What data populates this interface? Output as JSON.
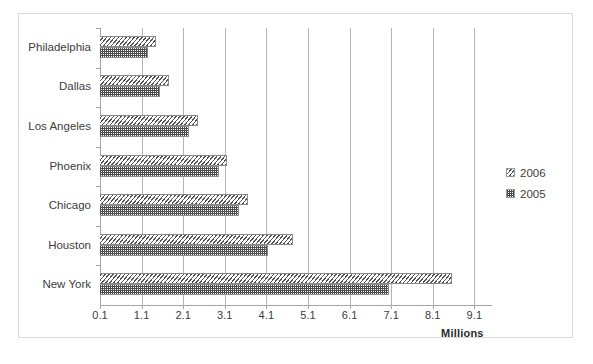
{
  "chart_data": {
    "type": "bar",
    "orientation": "horizontal",
    "title": "",
    "xlabel": "Millions",
    "ylabel": "",
    "grid": true,
    "legend_position": "right",
    "xlim": [
      0.1,
      9.6
    ],
    "xticks": [
      "0.1",
      "1.1",
      "2.1",
      "3.1",
      "4.1",
      "5.1",
      "6.1",
      "7.1",
      "8.1",
      "9.1"
    ],
    "xtick_values": [
      0.1,
      1.1,
      2.1,
      3.1,
      4.1,
      5.1,
      6.1,
      7.1,
      8.1,
      9.1
    ],
    "categories": [
      "Philadelphia",
      "Dallas",
      "Los Angeles",
      "Phoenix",
      "Chicago",
      "Houston",
      "New York"
    ],
    "series": [
      {
        "name": "2006",
        "pattern": "diagonal-hatch",
        "values": [
          1.45,
          1.75,
          2.45,
          3.15,
          3.65,
          4.75,
          8.55
        ]
      },
      {
        "name": "2005",
        "pattern": "checkered-dots",
        "values": [
          1.25,
          1.55,
          2.25,
          2.95,
          3.45,
          4.15,
          7.05
        ]
      }
    ]
  },
  "axis": {
    "x_title": "Millions"
  },
  "legend": {
    "entries": [
      {
        "label": "2006",
        "swatch": "diagonal-hatch-swatch"
      },
      {
        "label": "2005",
        "swatch": "checkered-dots-swatch"
      }
    ]
  },
  "colors": {
    "frame_border": "#d9d9d9",
    "gridline": "#b5b5b5",
    "axis": "#a6a6a6",
    "text": "#3d3d3d",
    "bar_ink": "#4a4a4a",
    "background": "#ffffff"
  }
}
